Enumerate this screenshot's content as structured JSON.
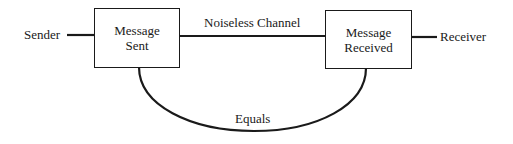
{
  "diagram": {
    "sender_label": "Sender",
    "receiver_label": "Receiver",
    "box_sent": {
      "line1": "Message",
      "line2": "Sent"
    },
    "box_received": {
      "line1": "Message",
      "line2": "Received"
    },
    "channel_label": "Noiseless Channel",
    "equals_label": "Equals",
    "stroke_color": "#1a1a1a"
  }
}
